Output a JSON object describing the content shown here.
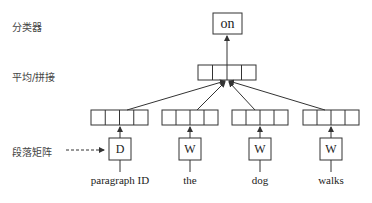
{
  "left_labels": {
    "classifier": "分类器",
    "average_concat": "平均/拼接",
    "paragraph_matrix": "段落矩阵"
  },
  "output_box": {
    "label": "on"
  },
  "input_boxes": [
    {
      "symbol": "D",
      "word": "paragraph ID"
    },
    {
      "symbol": "W",
      "word": "the"
    },
    {
      "symbol": "W",
      "word": "dog"
    },
    {
      "symbol": "W",
      "word": "walks"
    }
  ],
  "colors": {
    "line": "#333333",
    "text": "#222222",
    "label": "#444444"
  }
}
